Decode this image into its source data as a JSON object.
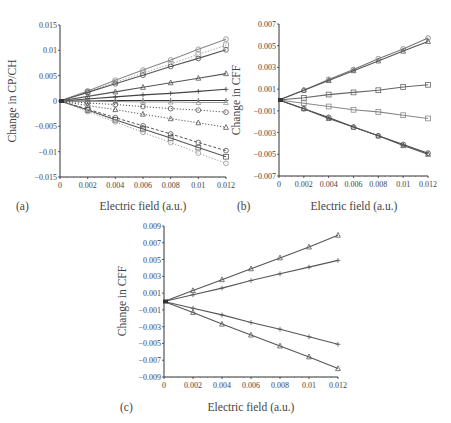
{
  "figure": {
    "panels": [
      {
        "id": "a",
        "label": "(a)",
        "xlabel": "Electric field (a.u.)",
        "ylabel": "Change in CP/CH"
      },
      {
        "id": "b",
        "label": "(b)",
        "xlabel": "Electric field (a.u.)",
        "ylabel": "Change in CFF"
      },
      {
        "id": "c",
        "label": "(c)",
        "xlabel": "Electric field (a.u.)",
        "ylabel": "Change in CFF"
      }
    ]
  },
  "chart_data": [
    {
      "panel": "(a)",
      "type": "line",
      "title": "",
      "xlabel": "Electric field (a.u.)",
      "ylabel": "Change in CP/CH",
      "xlim": [
        0,
        0.012
      ],
      "ylim": [
        -0.015,
        0.015
      ],
      "x_ticks": [
        "0",
        "0.002",
        "0.004",
        "0.006",
        "0.008",
        "0.01",
        "0.012"
      ],
      "y_ticks": [
        "0.015",
        "0.01",
        "0.005",
        "0",
        "-0.005",
        "-0.01",
        "-0.015"
      ],
      "grid": false,
      "legend": null,
      "x": [
        0,
        0.002,
        0.004,
        0.006,
        0.008,
        0.01,
        0.012
      ],
      "series": [
        {
          "name": "s1",
          "marker": "circle",
          "style": "solid",
          "color": "#888888",
          "values": [
            0,
            0.002,
            0.0041,
            0.0061,
            0.0081,
            0.0102,
            0.0122
          ]
        },
        {
          "name": "s2",
          "marker": "square",
          "style": "dotted",
          "color": "#999999",
          "values": [
            0,
            0.0018,
            0.0037,
            0.0055,
            0.0073,
            0.0092,
            0.011
          ]
        },
        {
          "name": "s3",
          "marker": "circle",
          "style": "solid",
          "color": "#555555",
          "values": [
            0,
            0.0017,
            0.0034,
            0.0051,
            0.0068,
            0.0084,
            0.0101
          ]
        },
        {
          "name": "s4",
          "marker": "triangle",
          "style": "solid",
          "color": "#555555",
          "values": [
            0,
            0.0009,
            0.0018,
            0.0027,
            0.0036,
            0.0045,
            0.0054
          ]
        },
        {
          "name": "s5",
          "marker": "plus",
          "style": "solid",
          "color": "#444444",
          "values": [
            0,
            0.0004,
            0.0008,
            0.0012,
            0.0015,
            0.0019,
            0.0023
          ]
        },
        {
          "name": "s6",
          "marker": "plus",
          "style": "solid",
          "color": "#333333",
          "values": [
            0,
            0.0,
            0.0001,
            0.0001,
            0.0001,
            0.0001,
            0.0001
          ]
        },
        {
          "name": "s7",
          "marker": "triangle",
          "style": "solid",
          "color": "#999999",
          "values": [
            0,
            -0.0001,
            -0.0001,
            -0.0002,
            -0.0002,
            -0.0003,
            -0.0003
          ]
        },
        {
          "name": "s8",
          "marker": "circle",
          "style": "dotted",
          "color": "#555555",
          "values": [
            0,
            -0.0004,
            -0.0007,
            -0.0011,
            -0.0015,
            -0.0018,
            -0.0022
          ]
        },
        {
          "name": "s9",
          "marker": "triangle",
          "style": "dotted",
          "color": "#555555",
          "values": [
            0,
            -0.0009,
            -0.0017,
            -0.0026,
            -0.0035,
            -0.0043,
            -0.0052
          ]
        },
        {
          "name": "s10",
          "marker": "circle",
          "style": "dashed",
          "color": "#555555",
          "values": [
            0,
            -0.0016,
            -0.0033,
            -0.0049,
            -0.0065,
            -0.0082,
            -0.0098
          ]
        },
        {
          "name": "s11",
          "marker": "square",
          "style": "solid",
          "color": "#555555",
          "values": [
            0,
            -0.0018,
            -0.0037,
            -0.0055,
            -0.0073,
            -0.0092,
            -0.011
          ]
        },
        {
          "name": "s12",
          "marker": "circle",
          "style": "dotted",
          "color": "#999999",
          "values": [
            0,
            -0.0021,
            -0.0041,
            -0.0062,
            -0.0082,
            -0.0103,
            -0.0123
          ]
        }
      ]
    },
    {
      "panel": "(b)",
      "type": "line",
      "title": "",
      "xlabel": "Electric field (a.u.)",
      "ylabel": "Change in CFF",
      "xlim": [
        0,
        0.012
      ],
      "ylim": [
        -0.007,
        0.007
      ],
      "x_ticks": [
        "0",
        "0.002",
        "0.004",
        "0.006",
        "0.008",
        "0.01",
        "0.012"
      ],
      "y_ticks": [
        "0.007",
        "0.005",
        "0.003",
        "0.001",
        "-0.001",
        "-0.003",
        "-0.005",
        "-0.007"
      ],
      "grid": false,
      "legend": null,
      "x": [
        0,
        0.002,
        0.004,
        0.006,
        0.008,
        0.01,
        0.012
      ],
      "series": [
        {
          "name": "s1",
          "marker": "circle",
          "style": "solid",
          "color": "#777777",
          "values": [
            0,
            0.0009,
            0.0019,
            0.0028,
            0.0038,
            0.0047,
            0.0057
          ]
        },
        {
          "name": "s2",
          "marker": "triangle",
          "style": "solid",
          "color": "#555555",
          "values": [
            0,
            0.0009,
            0.0018,
            0.0027,
            0.0036,
            0.0045,
            0.0054
          ]
        },
        {
          "name": "s3",
          "marker": "square",
          "style": "solid",
          "color": "#666666",
          "values": [
            0,
            0.0002,
            0.0005,
            0.0007,
            0.0009,
            0.0012,
            0.0014
          ]
        },
        {
          "name": "s4",
          "marker": "square",
          "style": "solid",
          "color": "#888888",
          "values": [
            0,
            -0.0003,
            -0.0006,
            -0.0009,
            -0.0011,
            -0.0014,
            -0.0017
          ]
        },
        {
          "name": "s5",
          "marker": "circle",
          "style": "solid",
          "color": "#444444",
          "values": [
            0,
            -0.0008,
            -0.0016,
            -0.0025,
            -0.0033,
            -0.0041,
            -0.0049
          ]
        },
        {
          "name": "s6",
          "marker": "triangle",
          "style": "solid",
          "color": "#555555",
          "values": [
            0,
            -0.0008,
            -0.0017,
            -0.0025,
            -0.0033,
            -0.0042,
            -0.005
          ]
        }
      ]
    },
    {
      "panel": "(c)",
      "type": "line",
      "title": "",
      "xlabel": "Electric field (a.u.)",
      "ylabel": "Change in CFF",
      "xlim": [
        0,
        0.012
      ],
      "ylim": [
        -0.009,
        0.009
      ],
      "x_ticks": [
        "0",
        "0.002",
        "0.004",
        "0.006",
        "0.008",
        "0.01",
        "0.012"
      ],
      "y_ticks": [
        "0.009",
        "0.007",
        "0.005",
        "0.003",
        "0.001",
        "-0.001",
        "-0.003",
        "-0.005",
        "-0.007",
        "-0.009"
      ],
      "grid": false,
      "legend": null,
      "x": [
        0,
        0.002,
        0.004,
        0.006,
        0.008,
        0.01,
        0.012
      ],
      "series": [
        {
          "name": "s1",
          "marker": "triangle",
          "style": "solid",
          "color": "#555555",
          "values": [
            0,
            0.0013,
            0.0026,
            0.0039,
            0.0052,
            0.0065,
            0.0079
          ]
        },
        {
          "name": "s2",
          "marker": "plus",
          "style": "solid",
          "color": "#555555",
          "values": [
            0,
            0.0008,
            0.0016,
            0.0025,
            0.0033,
            0.0041,
            0.0049
          ]
        },
        {
          "name": "s3",
          "marker": "plus",
          "style": "solid",
          "color": "#555555",
          "values": [
            0,
            -0.0008,
            -0.0016,
            -0.0025,
            -0.0033,
            -0.0042,
            -0.0051
          ]
        },
        {
          "name": "s4",
          "marker": "triangle",
          "style": "solid",
          "color": "#555555",
          "values": [
            0,
            -0.0013,
            -0.0027,
            -0.004,
            -0.0053,
            -0.0066,
            -0.008
          ]
        }
      ]
    }
  ],
  "layout": {
    "panels": [
      {
        "x0": 60,
        "x1": 226,
        "y0": 25,
        "y1": 177
      },
      {
        "x0": 279,
        "x1": 428,
        "y0": 24,
        "y1": 176
      },
      {
        "x0": 164,
        "x1": 338,
        "y0": 226,
        "y1": 377
      }
    ]
  }
}
